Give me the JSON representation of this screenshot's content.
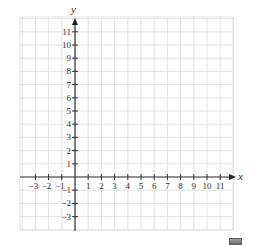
{
  "chart_data": {
    "type": "coordinate-grid",
    "title": "",
    "xlabel": "x",
    "ylabel": "y",
    "xlim": [
      -4,
      12
    ],
    "ylim": [
      -4,
      12
    ],
    "x_tick_labels": [
      "−3",
      "−2",
      "−1",
      "1",
      "2",
      "3",
      "4",
      "5",
      "6",
      "7",
      "8",
      "9",
      "10",
      "11"
    ],
    "x_ticks": [
      -3,
      -2,
      -1,
      1,
      2,
      3,
      4,
      5,
      6,
      7,
      8,
      9,
      10,
      11
    ],
    "y_tick_labels": [
      "11",
      "10",
      "9",
      "8",
      "7",
      "6",
      "5",
      "4",
      "3",
      "2",
      "1",
      "−1",
      "−2",
      "−3"
    ],
    "y_ticks": [
      11,
      10,
      9,
      8,
      7,
      6,
      5,
      4,
      3,
      2,
      1,
      -1,
      -2,
      -3
    ],
    "grid": true,
    "series": []
  },
  "colors": {
    "grid": "#dcdcdc",
    "axis": "#333333",
    "text": "#333333"
  },
  "axes": {
    "x_label": "x",
    "y_label": "y"
  }
}
